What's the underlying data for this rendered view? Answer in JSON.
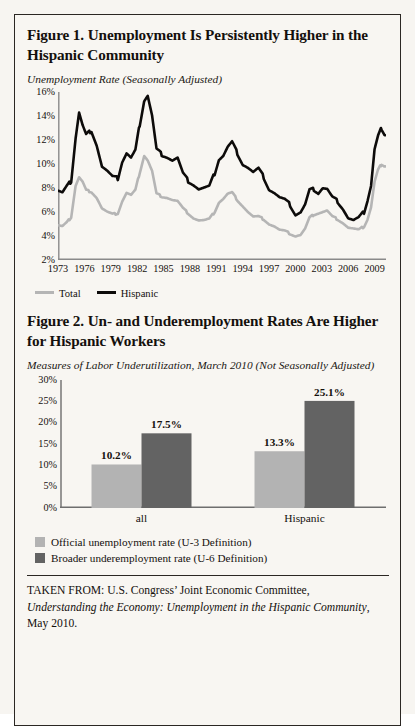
{
  "figure1": {
    "title": "Figure 1. Unemployment Is Persistently Higher in the Hispanic Community",
    "subtitle": "Unemployment Rate (Seasonally Adjusted)",
    "legend": [
      {
        "label": "Total",
        "color": "#b5b5b5"
      },
      {
        "label": "Hispanic",
        "color": "#0d0b0a"
      }
    ]
  },
  "figure2": {
    "title": "Figure 2. Un- and Underemployment Rates Are Higher for Hispanic Workers",
    "subtitle": "Measures of Labor Underutilization, March 2010 (Not Seasonally Adjusted)",
    "legend": [
      {
        "label": "Official unemployment rate (U-3 Definition)",
        "color": "#b3b3b3"
      },
      {
        "label": "Broader underemployment rate (U-6 Definition)",
        "color": "#636363"
      }
    ]
  },
  "source": {
    "line1": "TAKEN FROM: U.S. Congress’ Joint Economic Committee,",
    "line2_italic": "Understanding the Economy: Unemployment in the Hispanic Community",
    "line2_tail": ",",
    "line3": "May 2010."
  },
  "chart_data": [
    {
      "type": "line",
      "title": "Figure 1. Unemployment Is Persistently Higher in the Hispanic Community",
      "subtitle": "Unemployment Rate (Seasonally Adjusted)",
      "xlabel": "",
      "ylabel": "Unemployment Rate",
      "ylim": [
        2,
        16
      ],
      "yticks": [
        "2%",
        "4%",
        "6%",
        "8%",
        "10%",
        "12%",
        "14%",
        "16%"
      ],
      "ytick_values": [
        2,
        4,
        6,
        8,
        10,
        12,
        14,
        16
      ],
      "xlim": [
        1973,
        2010.3
      ],
      "xticks": [
        "1973",
        "1976",
        "1979",
        "1982",
        "1985",
        "1988",
        "1991",
        "1994",
        "1997",
        "2000",
        "2003",
        "2006",
        "2009"
      ],
      "xtick_values": [
        1973,
        1976,
        1979,
        1982,
        1985,
        1988,
        1991,
        1994,
        1997,
        2000,
        2003,
        2006,
        2009
      ],
      "grid": false,
      "legend_position": "below",
      "series": [
        {
          "name": "Total",
          "color": "#b5b5b5",
          "x": [
            1973.0,
            1973.5,
            1974.0,
            1974.5,
            1975.0,
            1975.4,
            1975.8,
            1976.2,
            1976.8,
            1977.4,
            1978.0,
            1978.6,
            1979.2,
            1979.8,
            1980.3,
            1980.8,
            1981.3,
            1981.8,
            1982.3,
            1982.8,
            1983.2,
            1983.7,
            1984.2,
            1984.8,
            1985.4,
            1986.0,
            1986.6,
            1987.2,
            1987.8,
            1988.4,
            1989.0,
            1989.6,
            1990.2,
            1990.8,
            1991.3,
            1991.8,
            1992.3,
            1992.8,
            1993.4,
            1994.0,
            1994.6,
            1995.2,
            1995.8,
            1996.4,
            1997.0,
            1997.6,
            1998.2,
            1998.8,
            1999.4,
            2000.0,
            2000.6,
            2001.1,
            2001.6,
            2002.1,
            2002.6,
            2003.1,
            2003.6,
            2004.2,
            2004.8,
            2005.4,
            2006.0,
            2006.6,
            2007.2,
            2007.8,
            2008.2,
            2008.6,
            2009.0,
            2009.4,
            2009.8,
            2010.2
          ],
          "y": [
            4.9,
            4.8,
            5.1,
            5.6,
            8.2,
            8.9,
            8.5,
            7.8,
            7.7,
            7.2,
            6.3,
            6.0,
            5.8,
            5.9,
            6.9,
            7.6,
            7.4,
            7.8,
            9.3,
            10.7,
            10.3,
            9.4,
            7.5,
            7.3,
            7.2,
            7.0,
            6.9,
            6.3,
            5.9,
            5.5,
            5.3,
            5.3,
            5.4,
            6.0,
            6.8,
            7.1,
            7.5,
            7.6,
            7.0,
            6.5,
            6.0,
            5.6,
            5.6,
            5.4,
            5.0,
            4.8,
            4.5,
            4.4,
            4.2,
            4.0,
            4.1,
            4.6,
            5.5,
            5.8,
            5.9,
            6.0,
            6.1,
            5.6,
            5.4,
            5.1,
            4.7,
            4.6,
            4.5,
            4.8,
            5.4,
            6.4,
            8.5,
            9.5,
            10.0,
            9.8
          ]
        },
        {
          "name": "Hispanic",
          "color": "#0d0b0a",
          "x": [
            1973.0,
            1973.5,
            1974.0,
            1974.5,
            1975.0,
            1975.4,
            1975.8,
            1976.2,
            1976.8,
            1977.4,
            1978.0,
            1978.6,
            1979.2,
            1979.8,
            1980.3,
            1980.8,
            1981.3,
            1981.8,
            1982.3,
            1982.8,
            1983.2,
            1983.7,
            1984.2,
            1984.8,
            1985.4,
            1986.0,
            1986.6,
            1987.2,
            1987.8,
            1988.4,
            1989.0,
            1989.6,
            1990.2,
            1990.8,
            1991.3,
            1991.8,
            1992.3,
            1992.8,
            1993.4,
            1994.0,
            1994.6,
            1995.2,
            1995.8,
            1996.4,
            1997.0,
            1997.6,
            1998.2,
            1998.8,
            1999.4,
            2000.0,
            2000.6,
            2001.1,
            2001.6,
            2002.1,
            2002.6,
            2003.1,
            2003.6,
            2004.2,
            2004.8,
            2005.4,
            2006.0,
            2006.6,
            2007.2,
            2007.8,
            2008.2,
            2008.6,
            2009.0,
            2009.4,
            2009.8,
            2010.2
          ],
          "y": [
            7.8,
            7.6,
            8.1,
            8.6,
            12.2,
            14.3,
            13.2,
            12.4,
            12.8,
            11.6,
            9.8,
            9.4,
            8.9,
            8.8,
            10.2,
            10.9,
            10.5,
            11.1,
            13.3,
            15.3,
            15.7,
            14.0,
            11.2,
            10.8,
            10.6,
            10.3,
            10.5,
            9.2,
            8.6,
            8.3,
            7.9,
            8.0,
            8.1,
            9.2,
            10.4,
            10.7,
            11.4,
            11.8,
            10.9,
            10.0,
            9.7,
            9.3,
            9.6,
            8.9,
            7.9,
            7.6,
            7.2,
            7.0,
            6.6,
            5.8,
            6.0,
            6.6,
            7.8,
            7.9,
            7.6,
            8.0,
            7.9,
            7.2,
            6.9,
            6.3,
            5.5,
            5.3,
            5.5,
            6.0,
            7.0,
            8.2,
            11.2,
            12.3,
            13.0,
            12.4
          ]
        }
      ]
    },
    {
      "type": "bar",
      "title": "Figure 2. Un- and Underemployment Rates Are Higher for Hispanic Workers",
      "subtitle": "Measures of Labor Underutilization, March 2010 (Not Seasonally Adjusted)",
      "categories": [
        "all",
        "Hispanic"
      ],
      "xlabel": "",
      "ylabel": "",
      "ylim": [
        0,
        30
      ],
      "yticks": [
        "0%",
        "5%",
        "10%",
        "15%",
        "20%",
        "25%",
        "30%"
      ],
      "ytick_values": [
        0,
        5,
        10,
        15,
        20,
        25,
        30
      ],
      "grid": false,
      "legend_position": "below",
      "series": [
        {
          "name": "Official unemployment rate (U-3 Definition)",
          "color": "#b3b3b3",
          "values": [
            10.2,
            13.3
          ],
          "labels": [
            "10.2%",
            "13.3%"
          ]
        },
        {
          "name": "Broader underemployment rate (U-6 Definition)",
          "color": "#636363",
          "values": [
            17.5,
            25.1
          ],
          "labels": [
            "17.5%",
            "25.1%"
          ]
        }
      ]
    }
  ]
}
